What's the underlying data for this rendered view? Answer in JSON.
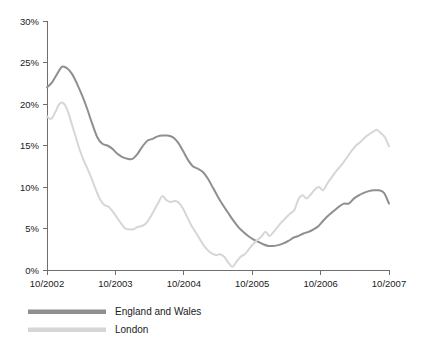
{
  "chart_data": {
    "type": "line",
    "title": "",
    "subtitle": "",
    "xlabel": "",
    "ylabel": "",
    "grid": false,
    "legend_position": "bottom-left",
    "xlim": [
      2002.75,
      2007.75
    ],
    "ylim": [
      0,
      30
    ],
    "ytick_values": [
      0,
      5,
      10,
      15,
      20,
      25,
      30
    ],
    "ytick_labels": [
      "0%",
      "5%",
      "10%",
      "15%",
      "20%",
      "25%",
      "30%"
    ],
    "xtick_values": [
      2002.75,
      2003.75,
      2004.75,
      2005.75,
      2006.75,
      2007.75
    ],
    "xtick_labels": [
      "10/2002",
      "10/2003",
      "10/2004",
      "10/2005",
      "10/2006",
      "10/2007"
    ],
    "x": [
      2002.75,
      2002.833,
      2002.917,
      2003.0,
      2003.083,
      2003.167,
      2003.25,
      2003.333,
      2003.417,
      2003.5,
      2003.583,
      2003.667,
      2003.75,
      2003.833,
      2003.917,
      2004.0,
      2004.083,
      2004.167,
      2004.25,
      2004.333,
      2004.417,
      2004.5,
      2004.583,
      2004.667,
      2004.75,
      2004.833,
      2004.917,
      2005.0,
      2005.083,
      2005.167,
      2005.25,
      2005.333,
      2005.417,
      2005.5,
      2005.583,
      2005.667,
      2005.75,
      2005.833,
      2005.917,
      2006.0,
      2006.083,
      2006.167,
      2006.25,
      2006.333,
      2006.417,
      2006.5,
      2006.583,
      2006.667,
      2006.75,
      2006.833,
      2006.917,
      2007.0,
      2007.083,
      2007.167,
      2007.25,
      2007.333,
      2007.417,
      2007.5,
      2007.583,
      2007.667,
      2007.75
    ],
    "series": [
      {
        "name": "England and Wales",
        "color": "#8f8f8f",
        "values": [
          22.0,
          22.6,
          23.6,
          24.5,
          24.3,
          23.6,
          22.4,
          21.0,
          19.4,
          17.6,
          16.0,
          15.2,
          15.0,
          14.6,
          14.0,
          13.6,
          13.4,
          13.4,
          14.0,
          14.9,
          15.6,
          15.8,
          16.1,
          16.2,
          16.2,
          16.0,
          15.4,
          14.4,
          13.3,
          12.5,
          12.2,
          11.8,
          11.0,
          9.9,
          8.8,
          7.8,
          6.9,
          6.0,
          5.2,
          4.6,
          4.1,
          3.7,
          3.4,
          3.1,
          2.9,
          2.9,
          3.0,
          3.2,
          3.5,
          3.9,
          4.1,
          4.4,
          4.6,
          4.9,
          5.3,
          6.0,
          6.6,
          7.1,
          7.6,
          8.0,
          8.0
        ]
      },
      {
        "name": "London",
        "color": "#d6d6d6",
        "values": [
          18.5,
          18.2,
          19.0,
          20.0,
          20.1,
          19.2,
          17.6,
          16.0,
          14.4,
          13.1,
          12.0,
          10.8,
          9.5,
          8.4,
          7.8,
          7.6,
          7.0,
          6.3,
          5.6,
          5.0,
          4.9,
          4.9,
          5.2,
          5.3,
          5.6,
          6.3,
          7.2,
          8.1,
          8.9,
          8.4,
          8.2,
          8.3,
          8.1,
          7.4,
          6.4,
          5.4,
          4.6,
          3.8,
          3.0,
          2.4,
          2.0,
          1.8,
          1.9,
          1.6,
          0.9,
          0.4,
          1.0,
          1.6,
          1.9,
          2.5,
          3.1,
          3.6,
          4.0,
          4.6,
          4.1,
          4.6,
          5.2,
          5.8,
          6.3,
          6.8,
          7.2
        ]
      }
    ],
    "series_right_tail": {
      "England and Wales": [
        8.0,
        8.6,
        9.0,
        9.3,
        9.5,
        9.6,
        9.6,
        9.3,
        8.0
      ],
      "London": [
        7.2,
        8.5,
        9.0,
        8.6,
        9.1,
        9.7,
        10.0,
        9.6,
        10.4,
        11.1,
        11.8,
        12.4,
        13.0,
        13.7,
        14.4,
        15.0,
        15.4,
        15.9,
        16.3,
        16.6,
        16.9,
        16.5,
        16.0,
        14.9
      ]
    }
  },
  "legend": {
    "items": [
      {
        "label": "England and Wales",
        "color": "#8f8f8f"
      },
      {
        "label": "London",
        "color": "#d6d6d6"
      }
    ]
  }
}
